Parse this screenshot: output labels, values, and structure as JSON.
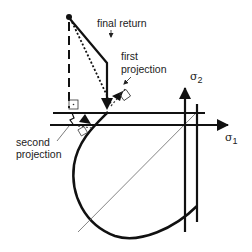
{
  "diagram": {
    "type": "return-mapping-projection",
    "labels": {
      "final_return": "final return",
      "first_projection_line1": "first",
      "first_projection_line2": "projection",
      "second_projection_line1": "second",
      "second_projection_line2": "projection"
    },
    "axes": {
      "x_symbol": "σ",
      "x_subscript": "1",
      "y_symbol": "σ",
      "y_subscript": "2"
    },
    "colors": {
      "stroke": "#111111",
      "thin": "#555555",
      "background": "#ffffff"
    }
  }
}
